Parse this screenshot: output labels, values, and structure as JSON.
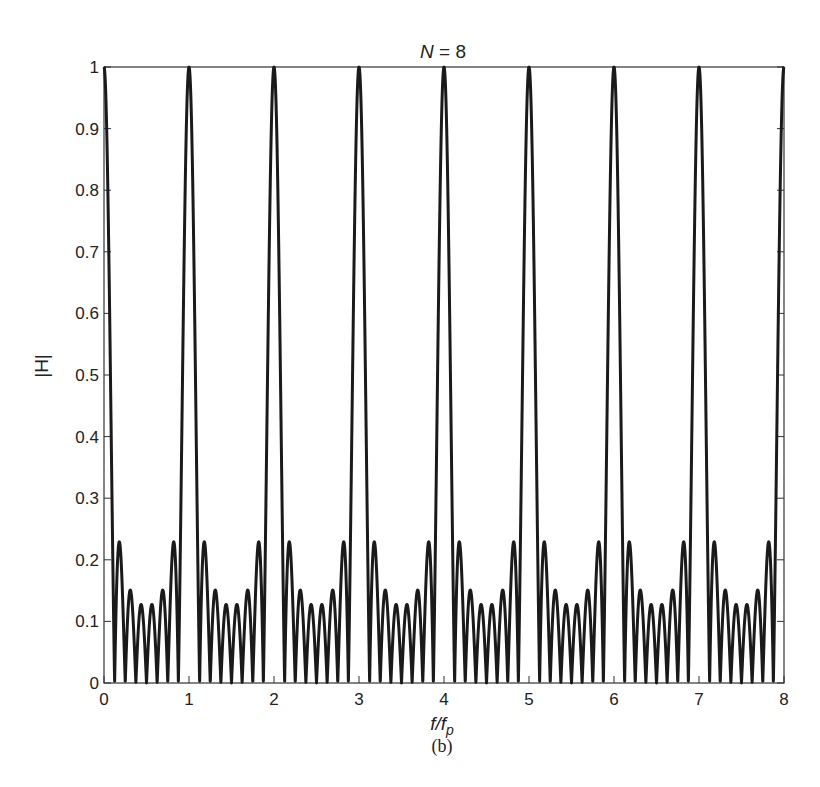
{
  "chart_data": {
    "type": "line",
    "title": "N = 8",
    "title_parts": {
      "var": "N",
      "rest": " = 8"
    },
    "xlabel": "f/f_p",
    "xlabel_parts": {
      "main": "f/f",
      "sub": "p"
    },
    "ylabel": "|H|",
    "caption": "(b)",
    "xlim": [
      0,
      8
    ],
    "ylim": [
      0,
      1
    ],
    "xticks": [
      0,
      1,
      2,
      3,
      4,
      5,
      6,
      7,
      8
    ],
    "xtick_labels": [
      "0",
      "1",
      "2",
      "3",
      "4",
      "5",
      "6",
      "7",
      "8"
    ],
    "yticks": [
      0,
      0.1,
      0.2,
      0.3,
      0.4,
      0.5,
      0.6,
      0.7,
      0.8,
      0.9,
      1
    ],
    "ytick_labels": [
      "0",
      "0.1",
      "0.2",
      "0.3",
      "0.4",
      "0.5",
      "0.6",
      "0.7",
      "0.8",
      "0.9",
      "1"
    ],
    "grid": false,
    "legend": null,
    "function": "|H(x)| = |sin(N*pi*x) / (N*sin(pi*x))|, N = 8, x = f/f_p",
    "N": 8,
    "main_lobe_peaks": {
      "x": [
        0,
        1,
        2,
        3,
        4,
        5,
        6,
        7,
        8
      ],
      "y": [
        1,
        1,
        1,
        1,
        1,
        1,
        1,
        1,
        1
      ]
    },
    "sidelobe_peaks_per_period": {
      "x_offsets": [
        0.18,
        0.3,
        0.43,
        0.57,
        0.7,
        0.82
      ],
      "y": [
        0.22,
        0.15,
        0.13,
        0.13,
        0.15,
        0.22
      ]
    },
    "zeros_per_period": [
      0.125,
      0.25,
      0.375,
      0.5,
      0.625,
      0.75,
      0.875
    ],
    "series": [
      {
        "name": "|H|",
        "color": "#1a1a1a",
        "line_width": 3
      }
    ]
  },
  "colors": {
    "line": "#1a1a1a",
    "axes": "#333333",
    "background": "#ffffff"
  }
}
